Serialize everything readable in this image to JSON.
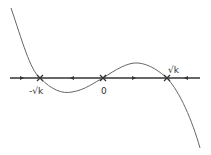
{
  "diagram": {
    "type": "phase-line",
    "labels": {
      "neg_root": "-√k",
      "zero": "0",
      "pos_root": "√k"
    },
    "fixed_points": [
      {
        "name": "neg-root",
        "label": "-√k",
        "x": 40
      },
      {
        "name": "zero",
        "label": "0",
        "x": 103
      },
      {
        "name": "pos-root",
        "label": "√k",
        "x": 167
      }
    ],
    "flow_arrows": [
      {
        "x": 22,
        "direction": "right"
      },
      {
        "x": 72,
        "direction": "left"
      },
      {
        "x": 134,
        "direction": "right"
      },
      {
        "x": 186,
        "direction": "left"
      }
    ],
    "colors": {
      "axis": "#333333",
      "curve": "#666666"
    }
  }
}
